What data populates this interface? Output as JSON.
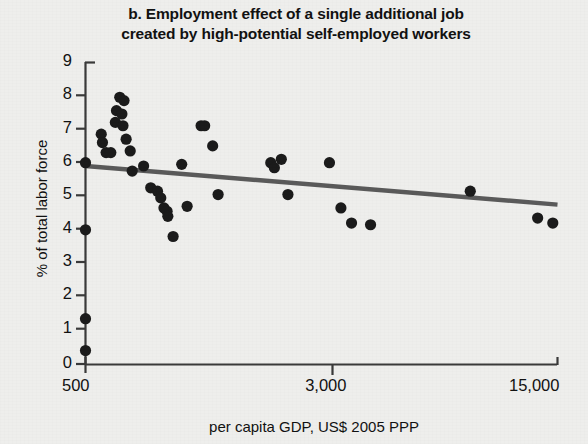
{
  "chart_data": {
    "type": "scatter",
    "title": "b.  Employment effect of a single additional job created by high-potential self-employed workers",
    "title_line1": "b.  Employment effect of a single additional job",
    "title_line2": "created by high-potential self-employed workers",
    "xlabel": "per capita GDP, US$ 2005 PPP",
    "ylabel": "% of total labor force",
    "xscale": "log",
    "xlim": [
      500,
      15000
    ],
    "ylim": [
      0,
      9
    ],
    "grid": false,
    "legend": null,
    "xtick_labels": [
      "500",
      "3,000",
      "15,000"
    ],
    "xtick_values": [
      500,
      3000,
      15000
    ],
    "ytick_labels": [
      "0",
      "1",
      "2",
      "3",
      "4",
      "5",
      "6",
      "7",
      "8",
      "9"
    ],
    "ytick_values": [
      0,
      1,
      2,
      3,
      4,
      5,
      6,
      7,
      8,
      9
    ],
    "marker_color": "#1b1b1b",
    "trendline_color": "#5a5a5a",
    "background_color": "#eeeeec",
    "series": [
      {
        "name": "countries",
        "points": [
          [
            500,
            6.0
          ],
          [
            500,
            4.0
          ],
          [
            500,
            1.35
          ],
          [
            500,
            0.4
          ],
          [
            560,
            6.85
          ],
          [
            565,
            6.6
          ],
          [
            580,
            6.3
          ],
          [
            600,
            6.3
          ],
          [
            620,
            7.2
          ],
          [
            625,
            7.55
          ],
          [
            640,
            7.95
          ],
          [
            660,
            7.85
          ],
          [
            650,
            7.45
          ],
          [
            655,
            7.1
          ],
          [
            670,
            6.7
          ],
          [
            690,
            6.35
          ],
          [
            700,
            5.75
          ],
          [
            760,
            5.9
          ],
          [
            800,
            5.25
          ],
          [
            840,
            5.15
          ],
          [
            860,
            4.95
          ],
          [
            880,
            4.65
          ],
          [
            900,
            4.55
          ],
          [
            905,
            4.4
          ],
          [
            940,
            3.8
          ],
          [
            1000,
            5.95
          ],
          [
            1040,
            4.7
          ],
          [
            1150,
            7.1
          ],
          [
            1180,
            7.1
          ],
          [
            1250,
            6.5
          ],
          [
            1300,
            5.05
          ],
          [
            1900,
            6.0
          ],
          [
            1950,
            5.85
          ],
          [
            2050,
            6.1
          ],
          [
            2150,
            5.05
          ],
          [
            2900,
            6.0
          ],
          [
            3150,
            4.65
          ],
          [
            3400,
            4.2
          ],
          [
            3900,
            4.15
          ],
          [
            8000,
            5.15
          ],
          [
            13000,
            4.35
          ],
          [
            14500,
            4.2
          ]
        ]
      }
    ],
    "trendline": {
      "name": "linear fit",
      "x_start": 500,
      "y_start": 5.9,
      "x_end": 15000,
      "y_end": 4.75
    }
  },
  "figure": {
    "panel_label": "b."
  }
}
